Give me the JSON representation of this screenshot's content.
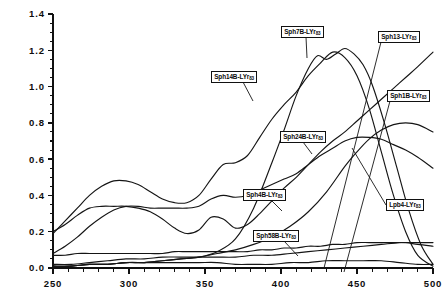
{
  "chart_data": {
    "type": "line",
    "title": "",
    "xlabel": "",
    "ylabel": "",
    "xlim": [
      250,
      500
    ],
    "ylim": [
      0.0,
      1.4
    ],
    "grid": false,
    "legend_position": "inline-callout-labels",
    "x_ticks": [
      250,
      300,
      350,
      400,
      450,
      500
    ],
    "x_tick_labels": [
      "250",
      "300",
      "350",
      "400",
      "450",
      "500"
    ],
    "x_minor_tick_step": 10,
    "y_ticks": [
      0.0,
      0.2,
      0.4,
      0.6,
      0.8,
      1.0,
      1.2,
      1.4
    ],
    "y_tick_labels": [
      "0.0",
      "0.2",
      "0.4",
      "0.6",
      "0.8",
      "1.0",
      "1.2",
      "1.4"
    ],
    "y_minor_tick_step": 0.05,
    "line_color": "#151515",
    "axis_color": "#111111",
    "background_color": "#ffffff",
    "series": [
      {
        "name": "Sph7B-LYr83",
        "label_text": "Sph7B-LYr",
        "label_sub": "83",
        "x": [
          250,
          258,
          266,
          274,
          282,
          290,
          298,
          306,
          314,
          322,
          330,
          338,
          346,
          354,
          362,
          370,
          378,
          386,
          394,
          402,
          410,
          418,
          426,
          434,
          442,
          450,
          458,
          466,
          474,
          482,
          490,
          500
        ],
        "values": [
          0.19,
          0.26,
          0.33,
          0.4,
          0.45,
          0.48,
          0.48,
          0.46,
          0.42,
          0.38,
          0.36,
          0.36,
          0.4,
          0.49,
          0.57,
          0.58,
          0.62,
          0.72,
          0.82,
          0.9,
          0.97,
          1.06,
          1.13,
          1.19,
          1.16,
          1.06,
          0.88,
          0.64,
          0.4,
          0.2,
          0.07,
          0.01
        ]
      },
      {
        "name": "Sph14B-LYr83",
        "label_text": "Sph14B-LYr",
        "label_sub": "83",
        "x": [
          250,
          258,
          266,
          274,
          282,
          290,
          298,
          306,
          314,
          322,
          330,
          338,
          346,
          354,
          362,
          370,
          378,
          386,
          394,
          402,
          410,
          418,
          426,
          434,
          442,
          450,
          458,
          466,
          474,
          482,
          490,
          500
        ],
        "values": [
          0.2,
          0.24,
          0.29,
          0.33,
          0.34,
          0.34,
          0.34,
          0.33,
          0.31,
          0.27,
          0.22,
          0.19,
          0.21,
          0.28,
          0.27,
          0.22,
          0.24,
          0.3,
          0.37,
          0.44,
          0.5,
          0.57,
          0.64,
          0.7,
          0.75,
          0.81,
          0.87,
          0.93,
          0.99,
          1.05,
          1.11,
          1.19
        ]
      },
      {
        "name": "Sph13-LYr83",
        "label_text": "Sph13-LYr",
        "label_sub": "83",
        "x": [
          250,
          262,
          274,
          286,
          298,
          310,
          322,
          334,
          346,
          358,
          370,
          382,
          394,
          402,
          410,
          418,
          424,
          430,
          436,
          442,
          448,
          454,
          460,
          468,
          476,
          484,
          492,
          500
        ],
        "values": [
          0.01,
          0.01,
          0.02,
          0.02,
          0.03,
          0.03,
          0.04,
          0.05,
          0.06,
          0.09,
          0.16,
          0.33,
          0.58,
          0.76,
          0.95,
          1.1,
          1.17,
          1.15,
          1.18,
          1.21,
          1.18,
          1.12,
          1.01,
          0.8,
          0.56,
          0.32,
          0.13,
          0.02
        ]
      },
      {
        "name": "Sph24B-LYr83",
        "label_text": "Sph24B-LYr",
        "label_sub": "83",
        "x": [
          250,
          258,
          266,
          274,
          282,
          290,
          298,
          306,
          314,
          322,
          330,
          338,
          346,
          354,
          362,
          370,
          378,
          386,
          394,
          402,
          410,
          418,
          426,
          434,
          442,
          450,
          458,
          466,
          474,
          482,
          490,
          500
        ],
        "values": [
          0.08,
          0.12,
          0.17,
          0.23,
          0.28,
          0.32,
          0.34,
          0.34,
          0.33,
          0.33,
          0.33,
          0.33,
          0.34,
          0.38,
          0.4,
          0.39,
          0.4,
          0.43,
          0.46,
          0.49,
          0.52,
          0.57,
          0.62,
          0.66,
          0.7,
          0.72,
          0.72,
          0.71,
          0.68,
          0.65,
          0.61,
          0.55
        ]
      },
      {
        "name": "Sph1B-LYr83",
        "label_text": "Sph1B-LYr",
        "label_sub": "83",
        "x": [
          250,
          262,
          274,
          286,
          298,
          310,
          322,
          334,
          346,
          358,
          370,
          382,
          394,
          406,
          418,
          430,
          442,
          450,
          458,
          466,
          474,
          482,
          490,
          500
        ],
        "values": [
          0.01,
          0.01,
          0.02,
          0.02,
          0.03,
          0.03,
          0.04,
          0.05,
          0.06,
          0.08,
          0.1,
          0.13,
          0.17,
          0.23,
          0.31,
          0.42,
          0.56,
          0.64,
          0.71,
          0.76,
          0.79,
          0.8,
          0.79,
          0.75
        ]
      },
      {
        "name": "Sph4B-LYr83",
        "label_text": "Sph4B-LYr",
        "label_sub": "83",
        "x": [
          250,
          258,
          266,
          274,
          282,
          290,
          298,
          306,
          314,
          322,
          330,
          338,
          346,
          354,
          362,
          370,
          378,
          386,
          394,
          402,
          410,
          418,
          426,
          434,
          442,
          450,
          458,
          466,
          474,
          482,
          490,
          500
        ],
        "values": [
          0.07,
          0.07,
          0.08,
          0.08,
          0.08,
          0.08,
          0.08,
          0.08,
          0.08,
          0.08,
          0.09,
          0.09,
          0.09,
          0.09,
          0.09,
          0.09,
          0.09,
          0.1,
          0.1,
          0.11,
          0.11,
          0.12,
          0.12,
          0.13,
          0.13,
          0.14,
          0.14,
          0.14,
          0.14,
          0.14,
          0.13,
          0.12
        ]
      },
      {
        "name": "Sph58B-LYr83",
        "label_text": "Sph58B-LYr",
        "label_sub": "83",
        "x": [
          250,
          262,
          274,
          286,
          298,
          310,
          322,
          334,
          346,
          358,
          370,
          382,
          394,
          406,
          418,
          430,
          442,
          454,
          466,
          478,
          490,
          500
        ],
        "values": [
          0.01,
          0.01,
          0.02,
          0.02,
          0.03,
          0.03,
          0.03,
          0.03,
          0.03,
          0.03,
          0.02,
          0.02,
          0.02,
          0.03,
          0.03,
          0.04,
          0.04,
          0.04,
          0.04,
          0.03,
          0.02,
          0.02
        ]
      },
      {
        "name": "Lpb4-LYr83",
        "label_text": "Lpb4-LYr",
        "label_sub": "83",
        "x": [
          250,
          262,
          274,
          286,
          298,
          310,
          322,
          334,
          346,
          358,
          370,
          382,
          394,
          406,
          418,
          430,
          442,
          454,
          466,
          478,
          490,
          500
        ],
        "values": [
          0.02,
          0.02,
          0.03,
          0.04,
          0.05,
          0.05,
          0.06,
          0.06,
          0.06,
          0.06,
          0.06,
          0.07,
          0.07,
          0.08,
          0.09,
          0.1,
          0.11,
          0.12,
          0.13,
          0.14,
          0.14,
          0.14
        ]
      }
    ],
    "callouts": [
      {
        "name": "Sph14B-LYr83",
        "label_left": 211,
        "label_top": 71,
        "leader": "M 243 82 L 253 101"
      },
      {
        "name": "Sph7B-LYr83",
        "label_left": 281,
        "label_top": 26,
        "leader": "M 306 37 L 307 58"
      },
      {
        "name": "Sph13-LYr83",
        "label_left": 378,
        "label_top": 31,
        "leader": "M 381 42 L 324 268"
      },
      {
        "name": "Sph1B-LYr83",
        "label_left": 387,
        "label_top": 90,
        "leader": "M 390 101 L 344 272"
      },
      {
        "name": "Sph24B-LYr83",
        "label_left": 280,
        "label_top": 131,
        "leader": "M 303 142 L 312 154"
      },
      {
        "name": "Sph4B-LYr83",
        "label_left": 243,
        "label_top": 189,
        "leader": "M 271 200 L 282 211"
      },
      {
        "name": "Sph58B-LYr83",
        "label_left": 253,
        "label_top": 230,
        "leader": "M 284 241 L 298 256"
      },
      {
        "name": "Lpb4-LYr83",
        "label_left": 386,
        "label_top": 199,
        "leader": "M 386 205 L 352 148"
      }
    ]
  }
}
